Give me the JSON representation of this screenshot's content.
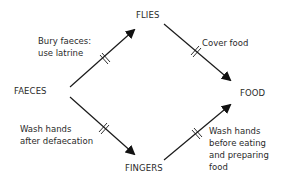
{
  "diagram": {
    "type": "transmission-barrier-diagram",
    "nodes": {
      "faeces": "FAECES",
      "flies": "FLIES",
      "food": "FOOD",
      "fingers": "FINGERS"
    },
    "edges": [
      {
        "from": "FAECES",
        "to": "FLIES",
        "barrier": "Bury faeces: use latrine"
      },
      {
        "from": "FLIES",
        "to": "FOOD",
        "barrier": "Cover food"
      },
      {
        "from": "FAECES",
        "to": "FINGERS",
        "barrier": "Wash hands after defaecation"
      },
      {
        "from": "FINGERS",
        "to": "FOOD",
        "barrier": "Wash hands before eating and preparing food"
      }
    ],
    "barrier_labels": {
      "bury_line1": "Bury faeces:",
      "bury_line2": "use latrine",
      "cover": "Cover food",
      "wash_after_line1": "Wash hands",
      "wash_after_line2": "after defaecation",
      "wash_before_line1": "Wash hands",
      "wash_before_line2": "before eating",
      "wash_before_line3": "and preparing",
      "wash_before_line4": "food"
    },
    "colors": {
      "line": "#1a1a1a",
      "text": "#2a2a2a",
      "background": "#ffffff"
    }
  }
}
